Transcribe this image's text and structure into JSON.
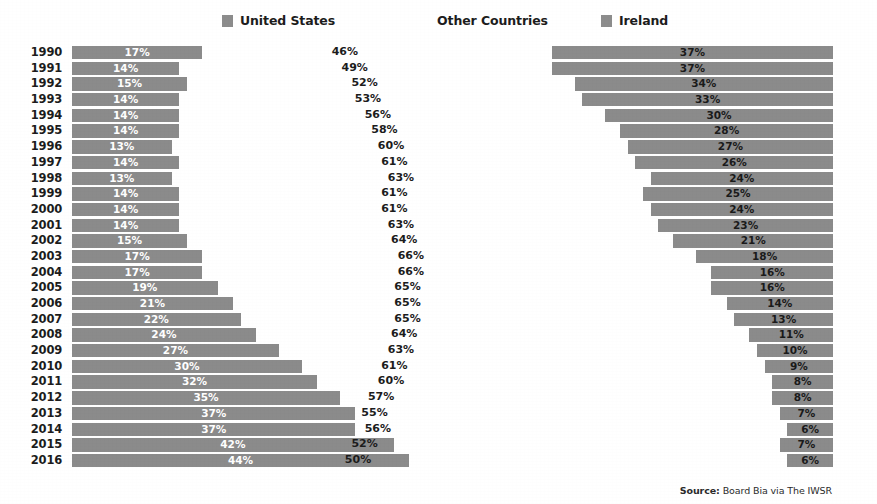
{
  "legend": {
    "items": [
      {
        "label": "United States",
        "swatch": true,
        "color": "#8b8b8b",
        "icon": "legend-swatch-icon"
      },
      {
        "label": "Other Countries",
        "swatch": false,
        "color": "#8b8b8b",
        "icon": "legend-swatch-icon"
      },
      {
        "label": "Ireland",
        "swatch": true,
        "color": "#8b8b8b",
        "icon": "legend-swatch-icon"
      }
    ]
  },
  "source": {
    "prefix": "Source:",
    "text": "Board Bia via The IWSR"
  },
  "chart_data": {
    "type": "bar",
    "title": "",
    "subtitle": "",
    "xlabel": "",
    "ylabel": "",
    "orientation": "horizontal",
    "grid": false,
    "legend_position": "top",
    "value_suffix": "%",
    "categories": [
      "1990",
      "1991",
      "1992",
      "1993",
      "1994",
      "1995",
      "1996",
      "1997",
      "1998",
      "1999",
      "2000",
      "2001",
      "2002",
      "2003",
      "2004",
      "2005",
      "2006",
      "2007",
      "2008",
      "2009",
      "2010",
      "2011",
      "2012",
      "2013",
      "2014",
      "2015",
      "2016"
    ],
    "series": [
      {
        "name": "United States",
        "color": "#8b8b8b",
        "render": "bar-left",
        "values": [
          17,
          14,
          15,
          14,
          14,
          14,
          13,
          14,
          13,
          14,
          14,
          14,
          15,
          17,
          17,
          19,
          21,
          22,
          24,
          27,
          30,
          32,
          35,
          37,
          37,
          42,
          44
        ],
        "labels": [
          "17%",
          "14%",
          "15%",
          "14%",
          "14%",
          "14%",
          "13%",
          "14%",
          "13%",
          "14%",
          "14%",
          "14%",
          "15%",
          "17%",
          "17%",
          "19%",
          "21%",
          "22%",
          "24%",
          "27%",
          "30%",
          "32%",
          "35%",
          "37%",
          "37%",
          "42%",
          "44%"
        ]
      },
      {
        "name": "Other Countries",
        "color": "#1c1c1c",
        "render": "label-only",
        "values": [
          46,
          49,
          52,
          53,
          56,
          58,
          60,
          61,
          63,
          61,
          61,
          63,
          64,
          66,
          66,
          65,
          65,
          65,
          64,
          63,
          61,
          60,
          57,
          55,
          56,
          52,
          50
        ],
        "labels": [
          "46%",
          "49%",
          "52%",
          "53%",
          "56%",
          "58%",
          "60%",
          "61%",
          "63%",
          "61%",
          "61%",
          "63%",
          "64%",
          "66%",
          "66%",
          "65%",
          "65%",
          "65%",
          "64%",
          "63%",
          "61%",
          "60%",
          "57%",
          "55%",
          "56%",
          "52%",
          "50%"
        ]
      },
      {
        "name": "Ireland",
        "color": "#8b8b8b",
        "render": "bar-right",
        "values": [
          37,
          37,
          34,
          33,
          30,
          28,
          27,
          26,
          24,
          25,
          24,
          23,
          21,
          18,
          16,
          16,
          14,
          13,
          11,
          10,
          9,
          8,
          8,
          7,
          6,
          7,
          6
        ],
        "labels": [
          "37%",
          "37%",
          "34%",
          "33%",
          "30%",
          "28%",
          "27%",
          "26%",
          "24%",
          "25%",
          "24%",
          "23%",
          "21%",
          "18%",
          "16%",
          "16%",
          "14%",
          "13%",
          "11%",
          "10%",
          "9%",
          "8%",
          "8%",
          "7%",
          "6%",
          "7%",
          "6%"
        ]
      }
    ],
    "xlim": [
      0,
      100
    ]
  }
}
